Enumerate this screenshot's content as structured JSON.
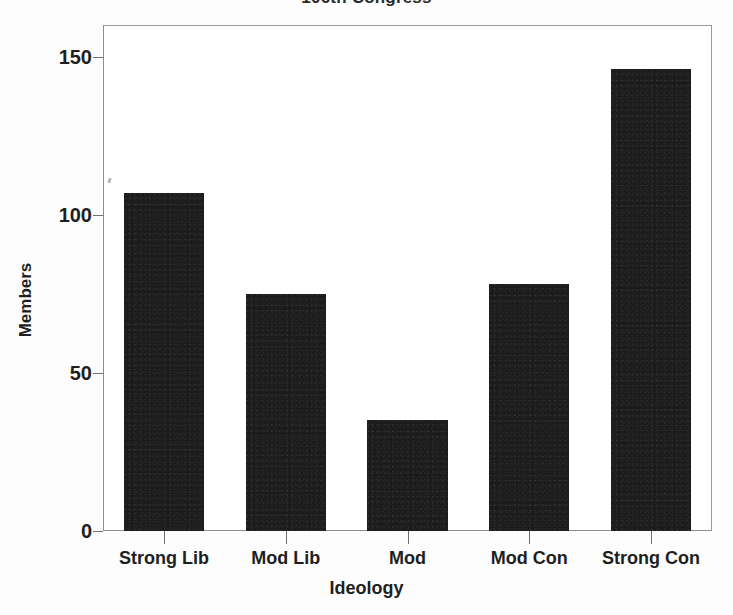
{
  "chart_data": {
    "type": "bar",
    "title": "106th Congress",
    "xlabel": "Ideology",
    "ylabel": "Members",
    "categories": [
      "Strong Lib",
      "Mod Lib",
      "Mod",
      "Mod Con",
      "Strong Con"
    ],
    "values": [
      107,
      75,
      35,
      78,
      146
    ],
    "ylim": [
      0,
      160
    ],
    "yticks": [
      0,
      50,
      100,
      150
    ],
    "ytick_labels": [
      "0",
      "50",
      "100",
      "150"
    ],
    "grid": false,
    "legend": null,
    "bar_color": "#1c1c1c",
    "background_color": "#ffffff",
    "frame_color": "#8c8c8c"
  },
  "axes": {
    "y_title": "Members",
    "x_title": "Ideology"
  }
}
